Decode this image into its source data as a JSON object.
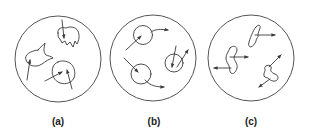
{
  "figure": {
    "background": "#ffffff",
    "stroke_color": "#3a3a3a",
    "panels": [
      {
        "id": "a",
        "label": "(a)",
        "description": "irregular shapes with internal arrows"
      },
      {
        "id": "b",
        "label": "(b)",
        "description": "circles with curved trajectory arrows"
      },
      {
        "id": "c",
        "label": "(c)",
        "description": "elongated squiggly shapes with straight arrows"
      }
    ]
  }
}
